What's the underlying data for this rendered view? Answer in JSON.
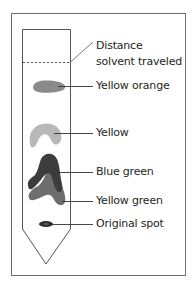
{
  "figure": {
    "colors": {
      "frame": "#6d6d6d",
      "line": "#3a3a3a",
      "text": "#231f20",
      "yellow_orange_spot": "#8a8a8a",
      "yellow_spot": "#b8b8b8",
      "blue_green_spot": "#3c3c3c",
      "yellow_green_spot": "#6e6e6e",
      "original_spot": "#2a2a2a"
    },
    "labels": {
      "solvent_front_line1": "Distance",
      "solvent_front_line2": "solvent traveled",
      "yellow_orange": "Yellow orange",
      "yellow": "Yellow",
      "blue_green": "Blue green",
      "yellow_green": "Yellow green",
      "original_spot": "Original spot"
    }
  }
}
